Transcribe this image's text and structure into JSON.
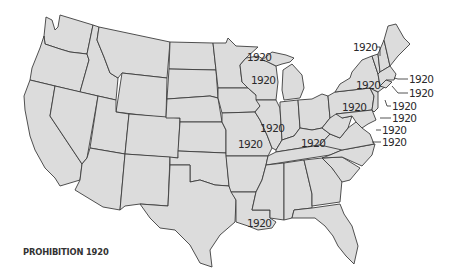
{
  "map": {
    "title": "PROHIBITION 1920",
    "fill_color": "#dcdcdc",
    "border_color": "#3d3d3d",
    "background_color": "#ffffff",
    "labels": [
      {
        "state": "Minnesota",
        "text": "1920"
      },
      {
        "state": "Wisconsin",
        "text": "1920"
      },
      {
        "state": "Missouri",
        "text": "1920"
      },
      {
        "state": "Illinois",
        "text": "1920"
      },
      {
        "state": "Kentucky",
        "text": "1920"
      },
      {
        "state": "Pennsylvania",
        "text": "1920"
      },
      {
        "state": "New York",
        "text": "1920"
      },
      {
        "state": "Vermont",
        "text": "1920"
      },
      {
        "state": "Massachusetts",
        "text": "1920"
      },
      {
        "state": "Rhode Island",
        "text": "1920"
      },
      {
        "state": "New Jersey",
        "text": "1920"
      },
      {
        "state": "Delaware",
        "text": "1920"
      },
      {
        "state": "Maryland",
        "text": "1920"
      },
      {
        "state": "Virginia",
        "text": "1920"
      },
      {
        "state": "Louisiana",
        "text": "1920"
      }
    ]
  }
}
